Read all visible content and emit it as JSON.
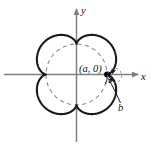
{
  "figure": {
    "name": "epicycloid-with-base-circle",
    "background": "#ffffff",
    "curve_color": "#1a1a1a",
    "axis_color": "#808080",
    "dashed_circle_color": "#8c8c8c",
    "point_color": "#000000",
    "labels": {
      "x_axis": "x",
      "y_axis": "y",
      "point": "(a, 0)",
      "radius": "b"
    }
  },
  "chart_data": {
    "type": "line",
    "title": "",
    "xlabel": "x",
    "ylabel": "y",
    "grid": false,
    "legend": null,
    "annotations": [
      {
        "text": "(a, 0)",
        "x": 0.78,
        "y": 0.12,
        "role": "cusp-point-label"
      },
      {
        "text": "b",
        "x": 0.92,
        "y": -0.42,
        "role": "rolling-circle-radius-label"
      },
      {
        "text": "x",
        "x": 1.45,
        "y": -0.08,
        "role": "axis-label"
      },
      {
        "text": "y",
        "x": 0.09,
        "y": 1.45,
        "role": "axis-label"
      }
    ],
    "series": [
      {
        "name": "epicycloid",
        "kind": "epicycloid",
        "cusps": 4,
        "base_radius_a": 0.78,
        "rolling_radius_b": 0.195,
        "style": "solid",
        "color": "#1a1a1a",
        "note": "four-lobed flower curve, one cusp on the positive x-axis at (a, 0)"
      },
      {
        "name": "base-circle",
        "kind": "circle",
        "center": [
          0,
          0
        ],
        "radius": 0.78,
        "style": "dashed",
        "color": "#8c8c8c"
      }
    ],
    "points": [
      {
        "label": "(a, 0)",
        "x": 0.78,
        "y": 0.0,
        "marker": "filled-dot"
      }
    ],
    "axes": {
      "xlim": [
        -1.55,
        1.55
      ],
      "ylim": [
        -1.55,
        1.55
      ],
      "arrows": [
        "x-positive",
        "y-positive"
      ]
    }
  }
}
